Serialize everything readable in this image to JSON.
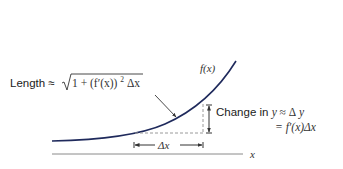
{
  "diagram": {
    "type": "arc-length-approximation",
    "curve_label": "f(x)",
    "axis_label": "x",
    "length_label": {
      "prefix": "Length ≈ ",
      "formula": "√(1 + (f′(x))²) Δx",
      "sqrt_symbol": "√",
      "radicand": "1 + (f′(x))",
      "exponent": "2",
      "suffix": "Δx"
    },
    "change_label": {
      "line1_prefix": "Change in ",
      "line1_var": "y",
      "line1_rel": " ≈ Δ",
      "line1_var2": "y",
      "line2": "= f′(x)Δx"
    },
    "delta_x_label": "Δx",
    "colors": {
      "curve": "#1f2a5c",
      "axis": "#888888",
      "dashed": "#999999",
      "arrow": "#333333",
      "text": "#222222"
    }
  }
}
